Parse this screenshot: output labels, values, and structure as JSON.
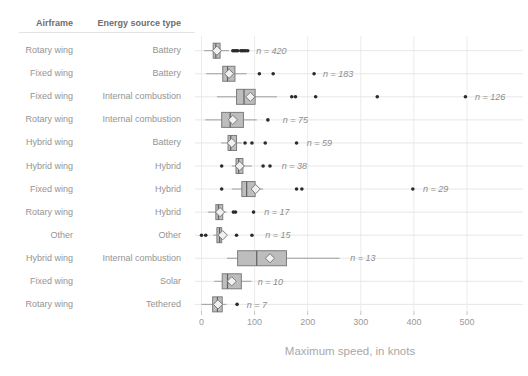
{
  "chart_data": {
    "type": "box",
    "orientation": "horizontal",
    "title": "",
    "xlabel": "Maximum speed, in knots",
    "columns": [
      "Airframe",
      "Energy source type"
    ],
    "x_ticks": [
      0,
      100,
      200,
      300,
      400,
      500
    ],
    "xlim": [
      -12,
      607
    ],
    "grid": true,
    "legend": "none",
    "colors": {
      "box_fill": "#bdbdbd",
      "box_border": "#7c7c7c",
      "whisker": "#9e9e9e",
      "median": "#5f5f5f",
      "mean_diamond_fill": "#f1f1f1",
      "outlier_dot": "#2b2b2b",
      "gridline": "#ececec",
      "row_line": "#e7e7e7",
      "tick": "#c6c6c6",
      "label_text": "#949494",
      "n_label_text": "#8d8d8d"
    },
    "rows": [
      {
        "airframe": "Rotary wing",
        "energy": "Battery",
        "n": 420,
        "label": "n = 420",
        "lo": 5,
        "q1": 22,
        "median": 27,
        "mean": 29,
        "q3": 35,
        "hi": 52,
        "outliers": [
          59,
          62,
          65,
          68,
          74,
          77,
          80,
          83,
          87
        ],
        "label_x": 103
      },
      {
        "airframe": "Fixed wing",
        "energy": "Battery",
        "n": 183,
        "label": "n = 183",
        "lo": 9,
        "q1": 40,
        "median": 49,
        "mean": 52,
        "q3": 63,
        "hi": 85,
        "outliers": [
          109,
          135,
          212
        ],
        "label_x": 229
      },
      {
        "airframe": "Fixed wing",
        "energy": "Internal combustion",
        "n": 126,
        "label": "n = 126",
        "lo": 29,
        "q1": 66,
        "median": 80,
        "mean": 92,
        "q3": 101,
        "hi": 142,
        "outliers": [
          170,
          177,
          215,
          331,
          497
        ],
        "label_x": 515
      },
      {
        "airframe": "Rotary wing",
        "energy": "Internal combustion",
        "n": 75,
        "label": "n = 75",
        "lo": 7,
        "q1": 38,
        "median": 54,
        "mean": 59,
        "q3": 79,
        "hi": 104,
        "outliers": [
          125
        ],
        "label_x": 153
      },
      {
        "airframe": "Hybrid wing",
        "energy": "Battery",
        "n": 59,
        "label": "n = 59",
        "lo": 37,
        "q1": 50,
        "median": 55,
        "mean": 57,
        "q3": 66,
        "hi": 76,
        "outliers": [
          82,
          95,
          120,
          179
        ],
        "label_x": 198
      },
      {
        "airframe": "Hybrid wing",
        "energy": "Hybrid",
        "n": 38,
        "label": "n = 38",
        "lo": 57,
        "q1": 65,
        "median": 70,
        "mean": 72,
        "q3": 78,
        "hi": 95,
        "outliers": [
          38,
          116,
          129
        ],
        "label_x": 151
      },
      {
        "airframe": "Fixed wing",
        "energy": "Hybrid",
        "n": 29,
        "label": "n = 29",
        "lo": 57,
        "q1": 76,
        "median": 85,
        "mean": 102,
        "q3": 101,
        "hi": 116,
        "outliers": [
          38,
          179,
          189,
          398
        ],
        "label_x": 417
      },
      {
        "airframe": "Rotary wing",
        "energy": "Hybrid",
        "n": 17,
        "label": "n = 17",
        "lo": 12,
        "q1": 27,
        "median": 32,
        "mean": 35,
        "q3": 40,
        "hi": 47,
        "outliers": [
          60,
          64,
          98
        ],
        "label_x": 118
      },
      {
        "airframe": "Other",
        "energy": "Other",
        "n": 15,
        "label": "n = 15",
        "lo": 22,
        "q1": 29,
        "median": 34,
        "mean": 40,
        "q3": 38,
        "hi": 46,
        "outliers": [
          0,
          8,
          66,
          95
        ],
        "label_x": 120
      },
      {
        "airframe": "Hybrid wing",
        "energy": "Internal combustion",
        "n": 13,
        "label": "n = 13",
        "lo": 48,
        "q1": 68,
        "median": 104,
        "mean": 129,
        "q3": 160,
        "hi": 260,
        "outliers": [],
        "label_x": 280
      },
      {
        "airframe": "Fixed wing",
        "energy": "Solar",
        "n": 10,
        "label": "n = 10",
        "lo": 24,
        "q1": 39,
        "median": 49,
        "mean": 57,
        "q3": 75,
        "hi": 94,
        "outliers": [],
        "label_x": 106
      },
      {
        "airframe": "Rotary wing",
        "energy": "Tethered",
        "n": 7,
        "label": "n = 7",
        "lo": 0,
        "q1": 21,
        "median": 30,
        "mean": 31,
        "q3": 39,
        "hi": 47,
        "outliers": [
          67
        ],
        "label_x": 85
      }
    ]
  }
}
